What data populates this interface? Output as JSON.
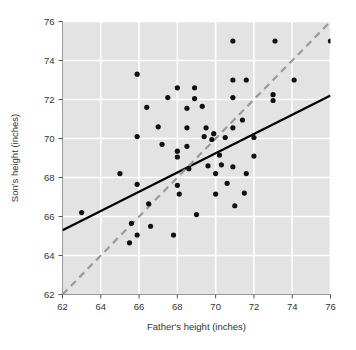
{
  "chart_data": {
    "type": "scatter",
    "title": "",
    "subtitle": "",
    "xlabel": "Father's height (inches)",
    "ylabel": "Son's height (inches)",
    "xlim": [
      62,
      76
    ],
    "ylim": [
      62,
      76
    ],
    "xticks": [
      62,
      64,
      66,
      68,
      70,
      72,
      74,
      76
    ],
    "yticks": [
      62,
      64,
      66,
      68,
      70,
      72,
      74,
      76
    ],
    "xtick_labels": [
      "62",
      "64",
      "66",
      "68",
      "70",
      "72",
      "74",
      "76"
    ],
    "ytick_labels": [
      "62",
      "64",
      "66",
      "68",
      "70",
      "72",
      "74",
      "76"
    ],
    "grid": true,
    "grid_color": "#ffffff",
    "plot_background": "#e3e3e3",
    "legend": null,
    "legend_position": "none",
    "point_color": "#111111",
    "point_radius": 2.6,
    "points": [
      {
        "x": 63.0,
        "y": 66.2
      },
      {
        "x": 65.0,
        "y": 68.2
      },
      {
        "x": 65.5,
        "y": 64.65
      },
      {
        "x": 65.6,
        "y": 65.65
      },
      {
        "x": 65.9,
        "y": 73.3
      },
      {
        "x": 65.9,
        "y": 70.1
      },
      {
        "x": 65.9,
        "y": 67.65
      },
      {
        "x": 65.9,
        "y": 65.05
      },
      {
        "x": 66.4,
        "y": 71.6
      },
      {
        "x": 66.5,
        "y": 66.65
      },
      {
        "x": 66.6,
        "y": 65.5
      },
      {
        "x": 67.0,
        "y": 70.6
      },
      {
        "x": 67.2,
        "y": 69.7
      },
      {
        "x": 67.5,
        "y": 72.1
      },
      {
        "x": 67.8,
        "y": 65.05
      },
      {
        "x": 68.0,
        "y": 72.6
      },
      {
        "x": 68.0,
        "y": 69.35
      },
      {
        "x": 68.0,
        "y": 69.05
      },
      {
        "x": 68.0,
        "y": 67.6
      },
      {
        "x": 68.1,
        "y": 67.15
      },
      {
        "x": 68.5,
        "y": 71.55
      },
      {
        "x": 68.5,
        "y": 70.55
      },
      {
        "x": 68.5,
        "y": 69.6
      },
      {
        "x": 68.6,
        "y": 68.45
      },
      {
        "x": 68.9,
        "y": 72.6
      },
      {
        "x": 68.9,
        "y": 72.05
      },
      {
        "x": 69.0,
        "y": 66.1
      },
      {
        "x": 69.3,
        "y": 71.65
      },
      {
        "x": 69.4,
        "y": 70.1
      },
      {
        "x": 69.5,
        "y": 70.55
      },
      {
        "x": 69.6,
        "y": 68.6
      },
      {
        "x": 69.8,
        "y": 69.95
      },
      {
        "x": 69.9,
        "y": 70.25
      },
      {
        "x": 70.0,
        "y": 68.2
      },
      {
        "x": 70.0,
        "y": 67.15
      },
      {
        "x": 70.2,
        "y": 69.15
      },
      {
        "x": 70.3,
        "y": 68.65
      },
      {
        "x": 70.5,
        "y": 70.05
      },
      {
        "x": 70.6,
        "y": 67.7
      },
      {
        "x": 70.9,
        "y": 75.0
      },
      {
        "x": 70.9,
        "y": 73.0
      },
      {
        "x": 70.9,
        "y": 72.1
      },
      {
        "x": 70.9,
        "y": 70.55
      },
      {
        "x": 70.9,
        "y": 68.55
      },
      {
        "x": 71.0,
        "y": 66.55
      },
      {
        "x": 71.4,
        "y": 70.95
      },
      {
        "x": 71.5,
        "y": 67.2
      },
      {
        "x": 71.6,
        "y": 68.2
      },
      {
        "x": 71.6,
        "y": 73.0
      },
      {
        "x": 72.0,
        "y": 70.05
      },
      {
        "x": 72.0,
        "y": 69.1
      },
      {
        "x": 73.0,
        "y": 72.25
      },
      {
        "x": 73.0,
        "y": 71.95
      },
      {
        "x": 73.1,
        "y": 75.0
      },
      {
        "x": 74.1,
        "y": 73.0
      },
      {
        "x": 76.0,
        "y": 75.0
      }
    ],
    "lines": [
      {
        "name": "regression-line",
        "style": "solid",
        "color": "#000000",
        "width": 2.2,
        "points": [
          {
            "x": 62,
            "y": 65.3
          },
          {
            "x": 76,
            "y": 72.2
          }
        ]
      },
      {
        "name": "identity-line",
        "style": "dashed",
        "color": "#9a9a9a",
        "width": 2.2,
        "dash": "7 5",
        "points": [
          {
            "x": 62,
            "y": 62
          },
          {
            "x": 76,
            "y": 76
          }
        ]
      }
    ]
  }
}
